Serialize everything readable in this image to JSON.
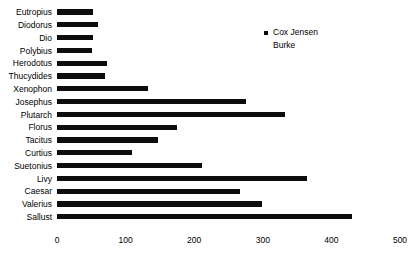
{
  "chart_data": {
    "type": "bar",
    "orientation": "horizontal",
    "title": "",
    "xlabel": "",
    "ylabel": "",
    "xlim": [
      0,
      500
    ],
    "xticks": [
      0,
      100,
      200,
      300,
      400,
      500
    ],
    "grid": false,
    "legend_position": "top-right",
    "bar_color": "#0d0d0d",
    "categories": [
      "Eutropius",
      "Diodorus",
      "Dio",
      "Polybius",
      "Herodotus",
      "Thucydides",
      "Xenophon",
      "Josephus",
      "Plutarch",
      "Florus",
      "Tacitus",
      "Curtius",
      "Suetonius",
      "Livy",
      "Caesar",
      "Valerius",
      "Sallust"
    ],
    "series": [
      {
        "name": "Cox Jensen",
        "color": "#0d0d0d",
        "values": [
          52,
          60,
          52,
          51,
          73,
          70,
          133,
          275,
          332,
          175,
          147,
          109,
          211,
          364,
          267,
          299,
          430
        ]
      },
      {
        "name": "Burke",
        "color": "#ffffff",
        "values": [
          0,
          0,
          0,
          0,
          0,
          0,
          0,
          0,
          0,
          0,
          0,
          0,
          0,
          0,
          0,
          0,
          0
        ]
      }
    ]
  },
  "legend": {
    "entries": [
      {
        "label": "Cox Jensen",
        "marker": "filled-square-marker"
      },
      {
        "label": "Burke",
        "marker": "empty-square-marker"
      }
    ]
  },
  "axis": {
    "tick_labels": [
      "0",
      "100",
      "200",
      "300",
      "400",
      "500"
    ]
  }
}
